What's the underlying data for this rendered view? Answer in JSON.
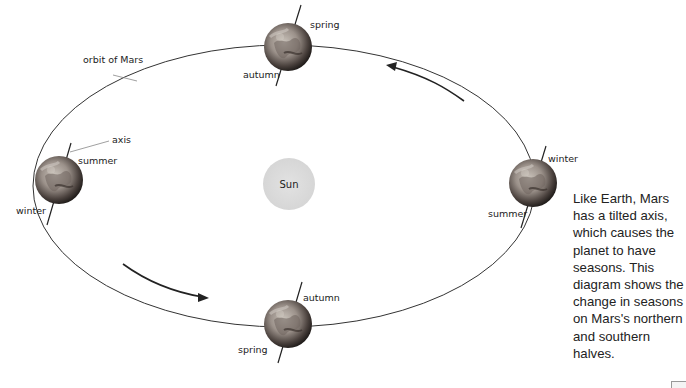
{
  "diagram": {
    "title_labels": {
      "orbit": "orbit of Mars",
      "axis": "axis",
      "sun": "Sun"
    },
    "planets": [
      {
        "position": "top",
        "labels": {
          "upper": "spring",
          "lower": "autumn"
        }
      },
      {
        "position": "left",
        "labels": {
          "upper": "summer",
          "lower": "winter"
        }
      },
      {
        "position": "right",
        "labels": {
          "upper": "winter",
          "lower": "summer"
        }
      },
      {
        "position": "bottom",
        "labels": {
          "upper": "autumn",
          "lower": "spring"
        }
      }
    ],
    "arrows": [
      {
        "name": "orbit-direction-upper",
        "direction": "counterclockwise"
      },
      {
        "name": "orbit-direction-lower",
        "direction": "counterclockwise"
      }
    ],
    "colors": {
      "orbit": "#333333",
      "sun": "#dcdcdc",
      "planet_dark": "#2a2522",
      "planet_light": "#b8b0a8"
    }
  },
  "caption": {
    "text": "Like Earth, Mars has a tilted axis, which causes the planet to have seasons. This diagram shows the change in seasons on Mars's northern and southern halves."
  }
}
